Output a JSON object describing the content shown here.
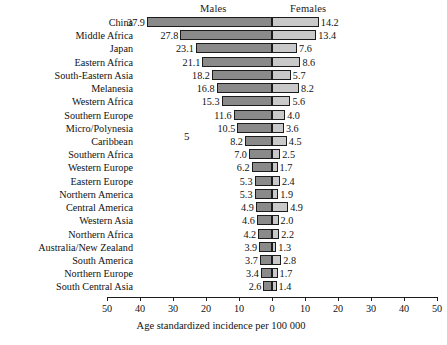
{
  "chart_data": {
    "type": "bar",
    "subtype": "diverging-population-pyramid",
    "title": "",
    "xlabel": "Age standardized incidence per 100 000",
    "ylabel": "",
    "xlim": [
      -50,
      50
    ],
    "grid": false,
    "legend_position": "top",
    "headers": {
      "left": "Males",
      "right": "Females"
    },
    "tick_labels": [
      "50",
      "40",
      "30",
      "20",
      "10",
      "0",
      "10",
      "20",
      "30",
      "40",
      "50"
    ],
    "tick_values": [
      -50,
      -40,
      -30,
      -20,
      -10,
      0,
      10,
      20,
      30,
      40,
      50
    ],
    "categories": [
      "China",
      "Middle Africa",
      "Japan",
      "Eastern Africa",
      "South-Eastern Asia",
      "Melanesia",
      "Western Africa",
      "Southern Europe",
      "Micro/Polynesia",
      "Caribbean",
      "Southern Africa",
      "Western Europe",
      "Eastern Europe",
      "Northern America",
      "Central America",
      "Western Asia",
      "Northern Africa",
      "Australia/New Zealand",
      "South America",
      "Northern Europe",
      "South Central Asia"
    ],
    "series": [
      {
        "name": "Males",
        "color": "#8a8a8a",
        "values": [
          37.9,
          27.8,
          23.1,
          21.1,
          18.2,
          16.8,
          15.3,
          11.6,
          10.5,
          8.2,
          7.0,
          6.2,
          5.3,
          5.3,
          4.9,
          4.6,
          4.2,
          3.9,
          3.7,
          3.4,
          2.6
        ]
      },
      {
        "name": "Females",
        "color": "#c9c9c9",
        "values": [
          14.2,
          13.4,
          7.6,
          8.6,
          5.7,
          8.2,
          5.6,
          4.0,
          3.6,
          4.5,
          2.5,
          1.7,
          2.4,
          1.9,
          4.9,
          2.0,
          2.2,
          1.3,
          2.8,
          1.7,
          1.4
        ]
      }
    ],
    "annotations": [
      {
        "text": "5",
        "note": "stray-mark"
      }
    ]
  }
}
